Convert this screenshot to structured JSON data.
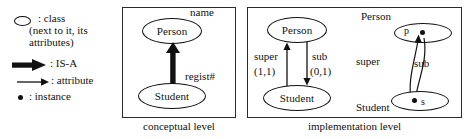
{
  "figure": {
    "width": 474,
    "height": 139,
    "background": "#ffffff",
    "ink_color": "#111111"
  },
  "legend": {
    "items": [
      {
        "icon": "ellipse-icon",
        "label": ": class",
        "sublabel": "(next to it, its attributes)"
      },
      {
        "icon": "thick-arrow-icon",
        "label": ": IS-A"
      },
      {
        "icon": "thin-arrow-icon",
        "label": ": attribute"
      },
      {
        "icon": "dot-icon",
        "label": ": instance"
      }
    ]
  },
  "conceptual": {
    "caption": "conceptual level",
    "classes": [
      {
        "name": "Person",
        "attribute": "name"
      },
      {
        "name": "Student",
        "attribute": "regist#"
      }
    ],
    "relation": {
      "type": "IS-A",
      "from": "Student",
      "to": "Person",
      "style": "thick-arrow"
    }
  },
  "implementation": {
    "caption": "implementation level",
    "schema": {
      "classes": [
        {
          "name": "Person"
        },
        {
          "name": "Student"
        }
      ],
      "attributes": [
        {
          "label": "super",
          "cardinality": "(1,1)",
          "direction": "up",
          "from": "Student",
          "to": "Person"
        },
        {
          "label": "sub",
          "cardinality": "(0,1)",
          "direction": "down",
          "from": "Person",
          "to": "Student"
        }
      ]
    },
    "instances": {
      "class_labels": [
        {
          "name": "Person",
          "position": "above"
        },
        {
          "name": "Student",
          "position": "below"
        }
      ],
      "objects": [
        {
          "id": "p",
          "label_side": "left",
          "belongs_to": "Person"
        },
        {
          "id": "s",
          "label_side": "right",
          "belongs_to": "Student"
        }
      ],
      "links": [
        {
          "label": "super",
          "direction": "up",
          "from": "s",
          "to": "p"
        },
        {
          "label": "sub",
          "direction": "down",
          "from": "p",
          "to": "s"
        }
      ]
    }
  }
}
